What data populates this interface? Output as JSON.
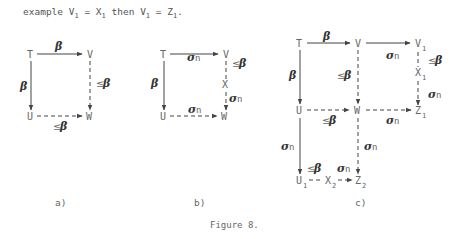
{
  "intro": {
    "prefix": "example V",
    "s1": "1",
    "eq1": " = X",
    "s2": "1",
    "mid": " then V",
    "s3": "1",
    "eq2": " = Z",
    "s4": "1",
    "end": "."
  },
  "nodes": {
    "T": "T",
    "U": "U",
    "V": "V",
    "W": "W",
    "X": "X",
    "Z": "Z",
    "sub1": "1",
    "sub2": "2"
  },
  "labels": {
    "beta": "β",
    "le": "≤",
    "sigma": "σ",
    "n": "n"
  },
  "panels": [
    "a)",
    "b)",
    "c)"
  ],
  "figure_caption": "Figure 8."
}
